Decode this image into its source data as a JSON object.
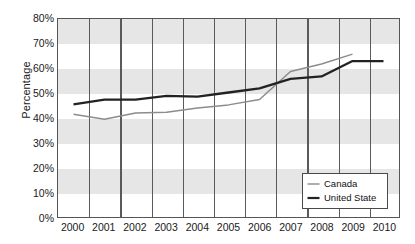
{
  "chart_data": {
    "type": "line",
    "title": "",
    "xlabel": "",
    "ylabel": "Percentage",
    "categories": [
      "2000",
      "2001",
      "2002",
      "2003",
      "2004",
      "2005",
      "2006",
      "2007",
      "2008",
      "2009",
      "2010"
    ],
    "x": [
      2000,
      2001,
      2002,
      2003,
      2004,
      2005,
      2006,
      2007,
      2008,
      2009,
      2010
    ],
    "ylim": [
      0,
      80
    ],
    "y_ticks": [
      0,
      10,
      20,
      30,
      40,
      50,
      60,
      70,
      80
    ],
    "y_tick_labels": [
      "0%",
      "10%",
      "20%",
      "30%",
      "40%",
      "50%",
      "60%",
      "70%",
      "80%"
    ],
    "grid": "vertical-gridlines-between-categories; alternating-horizontal-bands",
    "legend_position": "bottom-right",
    "series": [
      {
        "name": "Canada",
        "color": "#8c8c8c",
        "values": [
          41.5,
          39.5,
          42.0,
          42.3,
          44.0,
          45.3,
          47.5,
          58.8,
          61.8,
          65.8,
          null
        ]
      },
      {
        "name": "United State",
        "color": "#222222",
        "values": [
          45.5,
          47.4,
          47.4,
          48.9,
          48.6,
          50.3,
          52.0,
          55.8,
          56.8,
          63.0,
          63.0
        ]
      }
    ]
  },
  "axis": {
    "y_title": "Percentage"
  },
  "legend": {
    "entries": [
      {
        "label": "Canada"
      },
      {
        "label": "United State"
      }
    ]
  }
}
